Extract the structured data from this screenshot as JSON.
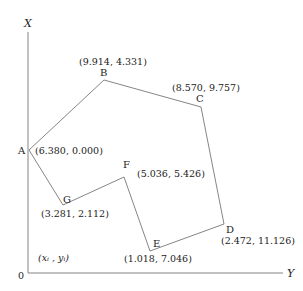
{
  "diagram": {
    "type": "traverse-polygon",
    "axes": {
      "vertical_label": "X",
      "horizontal_label": "Y",
      "origin_label": "0",
      "generic_coord_label": "(xᵢ ,  yᵢ)"
    },
    "points": [
      {
        "name": "A",
        "coord": "(6.380, 0.000)"
      },
      {
        "name": "B",
        "coord": "(9.914, 4.331)"
      },
      {
        "name": "C",
        "coord": "(8.570, 9.757)"
      },
      {
        "name": "D",
        "coord": "(2.472, 11.126)"
      },
      {
        "name": "E",
        "coord": "(1.018, 7.046)"
      },
      {
        "name": "F",
        "coord": "(5.036, 5.426)"
      },
      {
        "name": "G",
        "coord": "(3.281, 2.112)"
      }
    ],
    "line_color": "#777777"
  }
}
